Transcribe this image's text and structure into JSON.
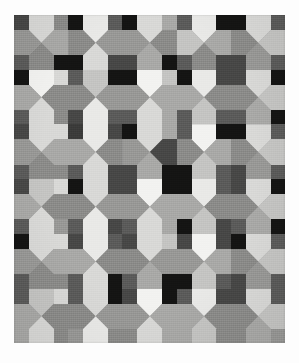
{
  "image": {
    "kind": "photograph",
    "subject": "patchwork quilt",
    "description": "Grayscale photograph of a patchwork quilt made of a 5 by 6 grid of square blocks; each block is divided into four triangles meeting at the centre, with small dark squares at the block corners that join into 2 by 2 dark clusters.",
    "palette_note": "monochrome / desaturated grays",
    "background_color": "#fdfdfd"
  },
  "quilt": {
    "label": "quilt-top",
    "x": 14,
    "y": 15,
    "width": 271,
    "height": 328,
    "columns": 5,
    "rows": 6,
    "block_width": 54.2,
    "block_height": 54.7,
    "corner_patch_size": 15,
    "binding_color": "#a0a0a0"
  },
  "colors": {
    "white": "#f2f2f0",
    "near_white": "#e9e9e7",
    "light": "#d8d8d6",
    "light_mid": "#c4c4c2",
    "mid": "#a8a8a6",
    "mid_gray": "#979795",
    "gray": "#8a8a88",
    "dark_gray": "#6f6f6e",
    "dark": "#5a5a59",
    "darker": "#474746",
    "charcoal": "#3a3a39",
    "black": "#141413"
  },
  "blocks": [
    [
      {
        "n": "light",
        "e": "mid",
        "s": "gray",
        "w": "mid_gray",
        "tl": "darker",
        "tr": "gray",
        "bl": "dark",
        "br": "black"
      },
      {
        "n": "near_white",
        "e": "mid_gray",
        "s": "light",
        "w": "gray",
        "tl": "black",
        "tr": "dark",
        "bl": "black",
        "br": "darker"
      },
      {
        "n": "light",
        "e": "gray",
        "s": "mid",
        "w": "mid_gray",
        "tl": "black",
        "tr": "mid",
        "bl": "darker",
        "br": "black"
      },
      {
        "n": "near_white",
        "e": "mid",
        "s": "gray",
        "w": "light_mid",
        "tl": "dark",
        "tr": "black",
        "bl": "dark",
        "br": "darker"
      },
      {
        "n": "light",
        "e": "light_mid",
        "s": "mid_gray",
        "w": "gray",
        "tl": "black",
        "tr": "dark",
        "bl": "darker",
        "br": "dark"
      }
    ],
    [
      {
        "n": "white",
        "e": "gray",
        "s": "light",
        "w": "mid",
        "tl": "black",
        "tr": "light",
        "bl": "dark",
        "br": "gray"
      },
      {
        "n": "light_mid",
        "e": "mid_gray",
        "s": "near_white",
        "w": "gray",
        "tl": "dark",
        "tr": "black",
        "bl": "darker",
        "br": "dark"
      },
      {
        "n": "white",
        "e": "mid",
        "s": "light",
        "w": "mid_gray",
        "tl": "black",
        "tr": "light_mid",
        "bl": "dark",
        "br": "mid"
      },
      {
        "n": "near_white",
        "e": "gray",
        "s": "light_mid",
        "w": "mid",
        "tl": "black",
        "tr": "darker",
        "bl": "dark",
        "br": "dark"
      },
      {
        "n": "light",
        "e": "light_mid",
        "s": "mid",
        "w": "gray",
        "tl": "darker",
        "tr": "black",
        "bl": "dark",
        "br": "black"
      }
    ],
    [
      {
        "n": "light",
        "e": "mid",
        "s": "gray",
        "w": "mid_gray",
        "tl": "darker",
        "tr": "light",
        "bl": "dark",
        "br": "gray"
      },
      {
        "n": "near_white",
        "e": "gray",
        "s": "light",
        "w": "mid",
        "tl": "charcoal",
        "tr": "darker",
        "bl": "dark",
        "br": "darker"
      },
      {
        "n": "light",
        "e": "darker",
        "s": "mid",
        "w": "mid_gray",
        "tl": "black",
        "tr": "mid",
        "bl": "darker",
        "br": "black"
      },
      {
        "n": "white",
        "e": "mid",
        "s": "light_mid",
        "w": "gray",
        "tl": "dark",
        "tr": "black",
        "bl": "black",
        "br": "dark"
      },
      {
        "n": "light",
        "e": "light_mid",
        "s": "mid_gray",
        "w": "gray",
        "tl": "black",
        "tr": "dark",
        "bl": "darker",
        "br": "dark"
      }
    ],
    [
      {
        "n": "light_mid",
        "e": "gray",
        "s": "light",
        "w": "mid",
        "tl": "darker",
        "tr": "light",
        "bl": "dark",
        "br": "mid_gray"
      },
      {
        "n": "light",
        "e": "mid_gray",
        "s": "near_white",
        "w": "gray",
        "tl": "black",
        "tr": "darker",
        "bl": "dark",
        "br": "darker"
      },
      {
        "n": "white",
        "e": "mid",
        "s": "light",
        "w": "mid_gray",
        "tl": "darker",
        "tr": "black",
        "bl": "dark",
        "br": "mid"
      },
      {
        "n": "near_white",
        "e": "gray",
        "s": "light_mid",
        "w": "mid",
        "tl": "black",
        "tr": "dark",
        "bl": "black",
        "br": "darker"
      },
      {
        "n": "light",
        "e": "light_mid",
        "s": "mid",
        "w": "gray",
        "tl": "darker",
        "tr": "black",
        "bl": "dark",
        "br": "black"
      }
    ],
    [
      {
        "n": "light",
        "e": "mid",
        "s": "gray",
        "w": "mid_gray",
        "tl": "black",
        "tr": "light",
        "bl": "dark",
        "br": "gray"
      },
      {
        "n": "near_white",
        "e": "gray",
        "s": "light",
        "w": "mid",
        "tl": "darker",
        "tr": "dark",
        "bl": "dark",
        "br": "black"
      },
      {
        "n": "light",
        "e": "mid_gray",
        "s": "mid",
        "w": "gray",
        "tl": "darker",
        "tr": "light_mid",
        "bl": "dark",
        "br": "black"
      },
      {
        "n": "white",
        "e": "mid",
        "s": "light_mid",
        "w": "mid_gray",
        "tl": "darker",
        "tr": "darker",
        "bl": "black",
        "br": "dark"
      },
      {
        "n": "light",
        "e": "light_mid",
        "s": "mid_gray",
        "w": "gray",
        "tl": "black",
        "tr": "dark",
        "bl": "darker",
        "br": "dark"
      }
    ],
    [
      {
        "n": "light_mid",
        "e": "gray",
        "s": "light",
        "w": "mid",
        "tl": "dark",
        "tr": "light",
        "bl": "mid",
        "br": "gray"
      },
      {
        "n": "light",
        "e": "mid_gray",
        "s": "near_white",
        "w": "gray",
        "tl": "dark",
        "tr": "black",
        "bl": "mid_gray",
        "br": "gray"
      },
      {
        "n": "white",
        "e": "mid",
        "s": "light",
        "w": "mid_gray",
        "tl": "darker",
        "tr": "black",
        "bl": "gray",
        "br": "mid"
      },
      {
        "n": "near_white",
        "e": "gray",
        "s": "light_mid",
        "w": "mid",
        "tl": "dark",
        "tr": "darker",
        "bl": "mid",
        "br": "gray"
      },
      {
        "n": "light",
        "e": "light_mid",
        "s": "mid",
        "w": "gray",
        "tl": "darker",
        "tr": "dark",
        "bl": "gray",
        "br": "mid_gray"
      }
    ]
  ]
}
